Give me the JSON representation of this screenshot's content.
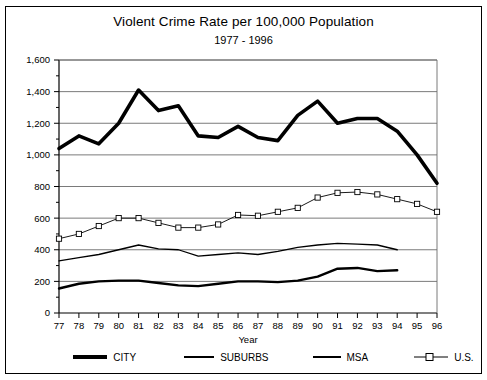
{
  "chart_data": {
    "type": "line",
    "title": "Violent Crime Rate per 100,000 Population",
    "subtitle": "1977 - 1996",
    "xlabel": "Year",
    "ylabel": "",
    "xlim": [
      77,
      96
    ],
    "ylim": [
      0,
      1600
    ],
    "ytick_step": 200,
    "yminor_step": 100,
    "grid": true,
    "legend_position": "bottom",
    "x": [
      77,
      78,
      79,
      80,
      81,
      82,
      83,
      84,
      85,
      86,
      87,
      88,
      89,
      90,
      91,
      92,
      93,
      94,
      95,
      96
    ],
    "xtick_labels": [
      "77",
      "78",
      "79",
      "80",
      "81",
      "82",
      "83",
      "84",
      "85",
      "86",
      "87",
      "88",
      "89",
      "90",
      "91",
      "92",
      "93",
      "94",
      "95",
      "96"
    ],
    "ytick_labels": [
      "0",
      "200",
      "400",
      "600",
      "800",
      "1,000",
      "1,200",
      "1,400",
      "1,600"
    ],
    "series": [
      {
        "name": "CITY",
        "style": "thick-solid",
        "color": "#000000",
        "x": [
          77,
          78,
          79,
          80,
          81,
          82,
          83,
          84,
          85,
          86,
          87,
          88,
          89,
          90,
          91,
          92,
          93,
          94,
          95,
          96
        ],
        "values": [
          1040,
          1120,
          1070,
          1200,
          1410,
          1280,
          1310,
          1120,
          1110,
          1180,
          1110,
          1090,
          1250,
          1340,
          1200,
          1230,
          1230,
          1150,
          1000,
          820
        ]
      },
      {
        "name": "SUBURBS",
        "style": "medium-solid",
        "color": "#000000",
        "x": [
          77,
          78,
          79,
          80,
          81,
          82,
          83,
          84,
          85,
          86,
          87,
          88,
          89,
          90,
          91,
          92,
          93,
          94
        ],
        "values": [
          155,
          185,
          200,
          205,
          205,
          190,
          175,
          170,
          185,
          200,
          200,
          195,
          205,
          230,
          280,
          285,
          265,
          270
        ]
      },
      {
        "name": "MSA",
        "style": "thin-solid",
        "color": "#000000",
        "x": [
          77,
          78,
          79,
          80,
          81,
          82,
          83,
          84,
          85,
          86,
          87,
          88,
          89,
          90,
          91,
          92,
          93,
          94
        ],
        "values": [
          330,
          350,
          370,
          400,
          430,
          405,
          400,
          360,
          370,
          380,
          370,
          390,
          415,
          430,
          440,
          435,
          430,
          400
        ]
      },
      {
        "name": "U.S.",
        "style": "thin-solid-square-markers",
        "color": "#000000",
        "marker": "open-square",
        "x": [
          77,
          78,
          79,
          80,
          81,
          82,
          83,
          84,
          85,
          86,
          87,
          88,
          89,
          90,
          91,
          92,
          93,
          94,
          95,
          96
        ],
        "values": [
          470,
          500,
          550,
          600,
          600,
          570,
          540,
          540,
          560,
          620,
          615,
          640,
          665,
          730,
          760,
          765,
          750,
          720,
          690,
          640
        ]
      }
    ]
  },
  "legend": {
    "items": [
      {
        "label": "CITY"
      },
      {
        "label": "SUBURBS"
      },
      {
        "label": "MSA"
      },
      {
        "label": "U.S."
      }
    ]
  }
}
